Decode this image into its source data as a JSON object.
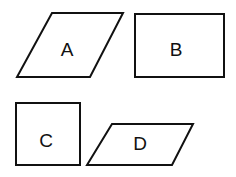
{
  "diagram": {
    "shapes": [
      {
        "id": "A",
        "kind": "parallelogram",
        "label": "A",
        "points": "52,13 123,13 90,77 17,77",
        "label_x": 67,
        "label_y": 49
      },
      {
        "id": "B",
        "kind": "rectangle",
        "label": "B",
        "points": "135,14 224,14 224,77 135,77",
        "label_x": 176,
        "label_y": 49
      },
      {
        "id": "C",
        "kind": "square",
        "label": "C",
        "points": "16,103 80,103 80,165 16,165",
        "label_x": 46,
        "label_y": 140
      },
      {
        "id": "D",
        "kind": "parallelogram",
        "label": "D",
        "points": "112,124 193,124 172,165 87,165",
        "label_x": 140,
        "label_y": 143
      }
    ]
  }
}
